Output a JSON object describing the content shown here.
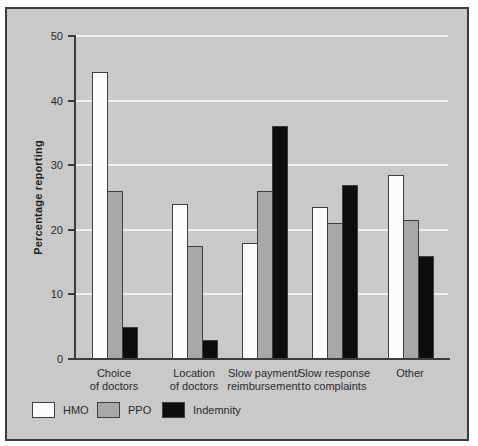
{
  "figure": {
    "outer_background": "#ffffff",
    "panel_background": "#c9c9c9",
    "panel_border_color": "#3c3c3c"
  },
  "chart_data": {
    "type": "bar",
    "title": "",
    "xlabel": "",
    "ylabel": "Percentage reporting",
    "ylim": [
      0,
      50
    ],
    "yticks": [
      0,
      10,
      20,
      30,
      40,
      50
    ],
    "grid": "horizontal",
    "gridline_color": "#f0f0f0",
    "axis_color": "#3c3c3c",
    "bar_border_color": "#3f3f3f",
    "text_color": "#2b2b2b",
    "legend_position": "bottom-left",
    "categories": [
      [
        "Choice",
        "of doctors"
      ],
      [
        "Location",
        "of doctors"
      ],
      [
        "Slow payment/",
        "reimbursement"
      ],
      [
        "Slow response",
        "to complaints"
      ],
      [
        "Other"
      ]
    ],
    "series": [
      {
        "name": "HMO",
        "color": "#fcfcfc",
        "values": [
          44.5,
          24,
          18,
          23.5,
          28.5
        ]
      },
      {
        "name": "PPO",
        "color": "#a8a8a8",
        "values": [
          26,
          17.5,
          26,
          21,
          21.5
        ]
      },
      {
        "name": "Indemnity",
        "color": "#0d0d0d",
        "values": [
          5,
          3,
          36,
          27,
          16
        ]
      }
    ]
  }
}
